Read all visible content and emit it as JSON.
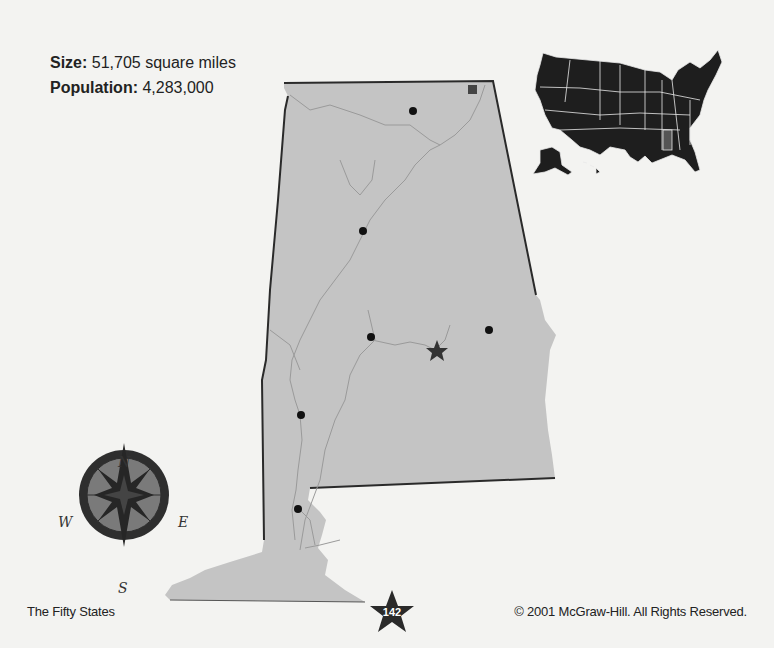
{
  "facts": {
    "size_label": "Size:",
    "size_value": " 51,705 square miles",
    "population_label": "Population:",
    "population_value": " 4,283,000"
  },
  "map": {
    "state_fill": "#c4c4c4",
    "state_outline": "#2a2a2a",
    "river_color": "#9a9a9a",
    "city_marker_color": "#111111",
    "capital_marker_color": "#333333",
    "city_markers": 6,
    "capital_marker": "star",
    "landmark_marker": "square"
  },
  "locator": {
    "fill": "#1e1e1e",
    "highlight_fill": "#555555",
    "border": "#e8e8e8"
  },
  "compass": {
    "north": "N",
    "south": "S",
    "east": "E",
    "west": "W"
  },
  "footer": {
    "left": "The Fifty States",
    "page_number": "142",
    "right": "© 2001 McGraw-Hill. All Rights Reserved."
  }
}
